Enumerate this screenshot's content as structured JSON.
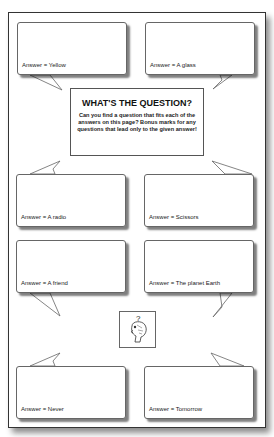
{
  "worksheet": {
    "title": "WHAT'S THE QUESTION?",
    "instructions": "Can you find a question that fits each of the answers on this page?  Bonus marks for any questions that lead only to the given answer!",
    "icon": "thinking-head-icon",
    "answers": [
      "Answer = Yellow",
      "Answer = A glass",
      "Answer = A radio",
      "Answer = Scissors",
      "Answer = A friend",
      "Answer = The planet Earth",
      "Answer = Never",
      "Answer = Tomorrow"
    ]
  }
}
